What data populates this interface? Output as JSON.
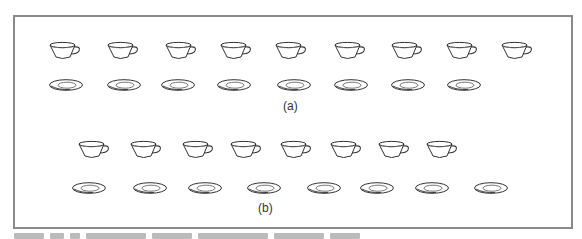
{
  "figure": {
    "panel_a": {
      "label": "(a)",
      "cups": 9,
      "saucers": 8,
      "cup_x": [
        48,
        106,
        164,
        219,
        274,
        333,
        390,
        445,
        500
      ],
      "saucer_x": [
        48,
        106,
        160,
        216,
        276,
        333,
        390,
        446
      ],
      "cup_y": 41,
      "saucer_y": 78
    },
    "panel_b": {
      "label": "(b)",
      "cups": 8,
      "saucers": 8,
      "cup_x": [
        77,
        129,
        181,
        229,
        279,
        329,
        377,
        425
      ],
      "saucer_x": [
        71,
        132,
        187,
        246,
        306,
        359,
        414,
        473
      ],
      "cup_y": 140,
      "saucer_y": 181
    },
    "caption_visible": false
  }
}
